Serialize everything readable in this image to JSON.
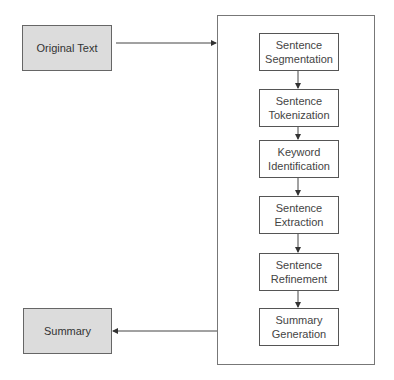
{
  "diagram": {
    "input": {
      "label": "Original Text"
    },
    "output": {
      "label": "Summary"
    },
    "pipeline": {
      "steps": [
        {
          "line1": "Sentence",
          "line2": "Segmentation"
        },
        {
          "line1": "Sentence",
          "line2": "Tokenization"
        },
        {
          "line1": "Keyword",
          "line2": "Identification"
        },
        {
          "line1": "Sentence",
          "line2": "Extraction"
        },
        {
          "line1": "Sentence",
          "line2": "Refinement"
        },
        {
          "line1": "Summary",
          "line2": "Generation"
        }
      ]
    },
    "colors": {
      "io_fill": "#dcdcdc",
      "border": "#666666",
      "line": "#444444"
    }
  }
}
